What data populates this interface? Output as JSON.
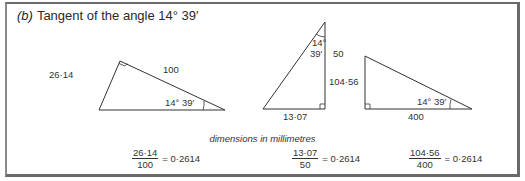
{
  "title": {
    "part_label": "(b)",
    "text": "Tangent of the angle 14° 39′"
  },
  "triangles": [
    {
      "opposite": "26·14",
      "hypotenuse": "100",
      "angle": "14° 39′"
    },
    {
      "opposite": "13·07",
      "adjacent": "50",
      "angle_deg": "14°",
      "angle_min": "39′"
    },
    {
      "opposite": "104·56",
      "adjacent": "400",
      "angle": "14° 39′"
    }
  ],
  "caption": "dimensions in millimetres",
  "equations": [
    {
      "numerator": "26·14",
      "denominator": "100",
      "result": "= 0·2614"
    },
    {
      "numerator": "13·07",
      "denominator": "50",
      "result": "= 0·2614"
    },
    {
      "numerator": "104·56",
      "denominator": "400",
      "result": "= 0·2614"
    }
  ]
}
